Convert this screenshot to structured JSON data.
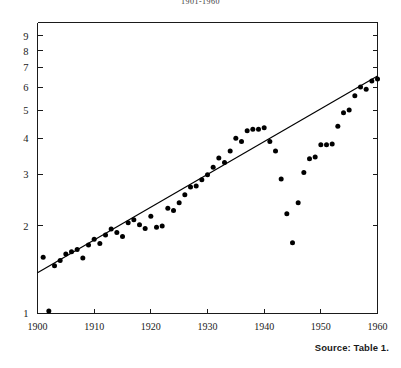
{
  "chart_data": {
    "type": "scatter",
    "title": "1901-1960",
    "xlabel": "",
    "ylabel": "",
    "xlim": [
      1900,
      1960
    ],
    "ylim": [
      1,
      10
    ],
    "yscale": "log",
    "grid": false,
    "legend": null,
    "xticks": [
      1900,
      1910,
      1920,
      1930,
      1940,
      1950,
      1960
    ],
    "xticklabels": [
      "1900",
      "1910",
      "1920",
      "1930",
      "1940",
      "1950",
      "1960"
    ],
    "yticks": [
      1,
      2,
      3,
      4,
      5,
      6,
      7,
      8,
      9
    ],
    "yticklabels": [
      "1",
      "2",
      "3",
      "4",
      "5",
      "6",
      "7",
      "8",
      "9"
    ],
    "series": [
      {
        "name": "observations",
        "marker": "filled-circle",
        "color": "#000000",
        "points": [
          [
            1901,
            1.56
          ],
          [
            1902,
            1.02
          ],
          [
            1903,
            1.46
          ],
          [
            1904,
            1.52
          ],
          [
            1905,
            1.6
          ],
          [
            1906,
            1.63
          ],
          [
            1907,
            1.66
          ],
          [
            1908,
            1.55
          ],
          [
            1909,
            1.72
          ],
          [
            1910,
            1.8
          ],
          [
            1911,
            1.74
          ],
          [
            1912,
            1.86
          ],
          [
            1913,
            1.95
          ],
          [
            1914,
            1.9
          ],
          [
            1915,
            1.84
          ],
          [
            1916,
            2.05
          ],
          [
            1917,
            2.1
          ],
          [
            1918,
            2.02
          ],
          [
            1919,
            1.96
          ],
          [
            1920,
            2.16
          ],
          [
            1921,
            1.98
          ],
          [
            1922,
            2.0
          ],
          [
            1923,
            2.3
          ],
          [
            1924,
            2.26
          ],
          [
            1925,
            2.4
          ],
          [
            1926,
            2.56
          ],
          [
            1927,
            2.72
          ],
          [
            1928,
            2.74
          ],
          [
            1929,
            2.88
          ],
          [
            1930,
            3.0
          ],
          [
            1931,
            3.18
          ],
          [
            1932,
            3.42
          ],
          [
            1933,
            3.3
          ],
          [
            1934,
            3.62
          ],
          [
            1935,
            4.0
          ],
          [
            1936,
            3.9
          ],
          [
            1937,
            4.25
          ],
          [
            1938,
            4.3
          ],
          [
            1939,
            4.3
          ],
          [
            1940,
            4.35
          ],
          [
            1941,
            3.9
          ],
          [
            1942,
            3.62
          ],
          [
            1943,
            2.9
          ],
          [
            1944,
            2.2
          ],
          [
            1945,
            1.75
          ],
          [
            1946,
            2.4
          ],
          [
            1947,
            3.05
          ],
          [
            1948,
            3.4
          ],
          [
            1949,
            3.45
          ],
          [
            1950,
            3.8
          ],
          [
            1951,
            3.8
          ],
          [
            1952,
            3.82
          ],
          [
            1953,
            4.4
          ],
          [
            1954,
            4.9
          ],
          [
            1955,
            5.0
          ],
          [
            1956,
            5.6
          ],
          [
            1957,
            6.0
          ],
          [
            1958,
            5.9
          ],
          [
            1959,
            6.3
          ],
          [
            1960,
            6.4
          ]
        ]
      }
    ],
    "trendline": {
      "name": "fitted-trend",
      "color": "#000000",
      "x0": 1900,
      "y0": 1.38,
      "x1": 1960,
      "y1": 6.55
    },
    "source_note": "Source: Table 1."
  }
}
